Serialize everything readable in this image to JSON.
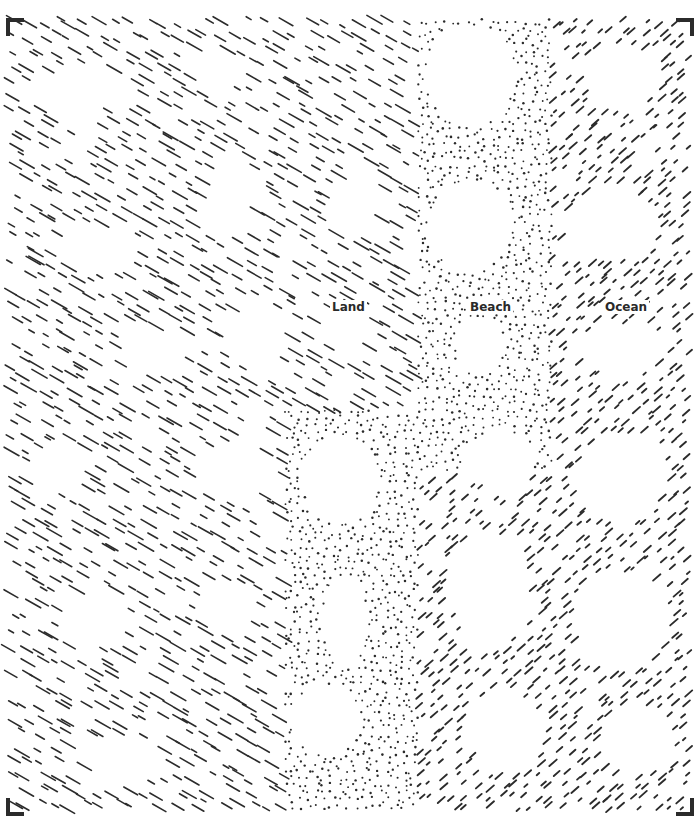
{
  "figure": {
    "width": 698,
    "height": 820,
    "frame": {
      "left": 8,
      "top": 18,
      "right": 690,
      "bottom": 812
    },
    "ink_color": "#2b2b2b",
    "background": "#ffffff",
    "seed": 12345
  },
  "regions": [
    {
      "id": "land",
      "label": "Land",
      "texture": "diagonal-dashes-backslash",
      "label_pos": {
        "x": 330,
        "y": 300
      },
      "polygon": [
        [
          8,
          18
        ],
        [
          418,
          18
        ],
        [
          418,
          410
        ],
        [
          285,
          410
        ],
        [
          285,
          812
        ],
        [
          8,
          812
        ]
      ],
      "spacing": 15,
      "dash_length": 16
    },
    {
      "id": "beach",
      "label": "Beach",
      "texture": "dots",
      "label_pos": {
        "x": 468,
        "y": 300
      },
      "polygon": [
        [
          418,
          18
        ],
        [
          552,
          18
        ],
        [
          552,
          470
        ],
        [
          418,
          470
        ],
        [
          418,
          812
        ],
        [
          285,
          812
        ],
        [
          285,
          410
        ],
        [
          418,
          410
        ]
      ],
      "spacing": 8
    },
    {
      "id": "ocean",
      "label": "Ocean",
      "texture": "diagonal-dashes-slash",
      "label_pos": {
        "x": 603,
        "y": 300
      },
      "polygon": [
        [
          552,
          18
        ],
        [
          690,
          18
        ],
        [
          690,
          812
        ],
        [
          418,
          812
        ],
        [
          418,
          470
        ],
        [
          552,
          470
        ]
      ],
      "spacing": 12,
      "dash_length": 9
    }
  ],
  "holes": [
    {
      "cx": 470,
      "cy": 75,
      "rx": 45,
      "ry": 50
    },
    {
      "cx": 470,
      "cy": 225,
      "rx": 42,
      "ry": 45
    },
    {
      "cx": 480,
      "cy": 345,
      "rx": 25,
      "ry": 28
    },
    {
      "cx": 620,
      "cy": 75,
      "rx": 40,
      "ry": 32
    },
    {
      "cx": 610,
      "cy": 225,
      "rx": 45,
      "ry": 35
    },
    {
      "cx": 620,
      "cy": 350,
      "rx": 45,
      "ry": 25
    },
    {
      "cx": 340,
      "cy": 480,
      "rx": 38,
      "ry": 45
    },
    {
      "cx": 500,
      "cy": 460,
      "rx": 35,
      "ry": 30
    },
    {
      "cx": 620,
      "cy": 480,
      "rx": 45,
      "ry": 45
    },
    {
      "cx": 345,
      "cy": 620,
      "rx": 22,
      "ry": 45
    },
    {
      "cx": 325,
      "cy": 720,
      "rx": 35,
      "ry": 35
    },
    {
      "cx": 490,
      "cy": 590,
      "rx": 40,
      "ry": 60
    },
    {
      "cx": 620,
      "cy": 620,
      "rx": 48,
      "ry": 48
    },
    {
      "cx": 505,
      "cy": 730,
      "rx": 40,
      "ry": 40
    },
    {
      "cx": 640,
      "cy": 740,
      "rx": 35,
      "ry": 35
    },
    {
      "cx": 80,
      "cy": 90,
      "rx": 38,
      "ry": 28
    },
    {
      "cx": 220,
      "cy": 70,
      "rx": 30,
      "ry": 20
    },
    {
      "cx": 230,
      "cy": 200,
      "rx": 28,
      "ry": 40
    },
    {
      "cx": 100,
      "cy": 250,
      "rx": 35,
      "ry": 25
    },
    {
      "cx": 360,
      "cy": 200,
      "rx": 25,
      "ry": 35
    },
    {
      "cx": 150,
      "cy": 350,
      "rx": 35,
      "ry": 22
    },
    {
      "cx": 260,
      "cy": 340,
      "rx": 30,
      "ry": 30
    },
    {
      "cx": 60,
      "cy": 470,
      "rx": 30,
      "ry": 25
    },
    {
      "cx": 230,
      "cy": 470,
      "rx": 30,
      "ry": 30
    },
    {
      "cx": 90,
      "cy": 620,
      "rx": 35,
      "ry": 30
    },
    {
      "cx": 230,
      "cy": 610,
      "rx": 30,
      "ry": 25
    },
    {
      "cx": 120,
      "cy": 760,
      "rx": 35,
      "ry": 25
    },
    {
      "cx": 350,
      "cy": 330,
      "rx": 25,
      "ry": 25
    }
  ],
  "labels": {
    "land": "Land",
    "beach": "Beach",
    "ocean": "Ocean"
  }
}
